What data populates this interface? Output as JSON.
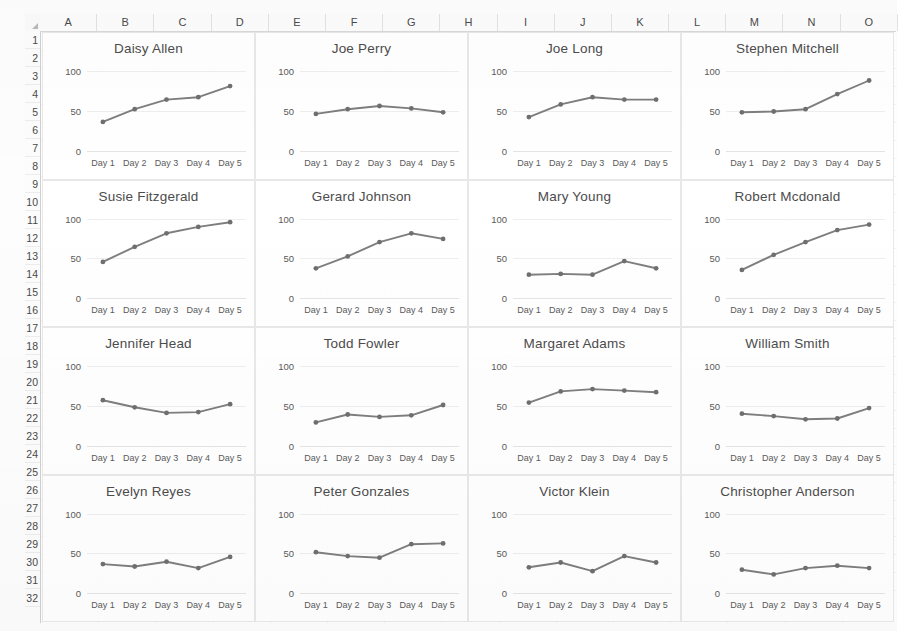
{
  "spreadsheet": {
    "select_all_icon": "select-all-triangle",
    "columns": [
      "A",
      "B",
      "C",
      "D",
      "E",
      "F",
      "G",
      "H",
      "I",
      "J",
      "K",
      "L",
      "M",
      "N",
      "O"
    ],
    "rows": [
      "1",
      "2",
      "3",
      "4",
      "5",
      "6",
      "7",
      "8",
      "9",
      "10",
      "11",
      "12",
      "13",
      "14",
      "15",
      "16",
      "17",
      "18",
      "19",
      "20",
      "21",
      "22",
      "23",
      "24",
      "25",
      "26",
      "27",
      "28",
      "29",
      "30",
      "31",
      "32"
    ]
  },
  "style": {
    "line_color": "#7e7e7e",
    "marker_color": "#6f6f6f",
    "gridline_color": "#eeeeee",
    "text_color": "#4c4c4c",
    "header_bg": "#fcfcfc"
  },
  "chart_data": [
    {
      "type": "line",
      "title": "Daisy Allen",
      "categories": [
        "Day 1",
        "Day 2",
        "Day 3",
        "Day 4",
        "Day 5"
      ],
      "values": [
        36,
        52,
        64,
        67,
        81
      ],
      "ylim": [
        0,
        100
      ],
      "yticks": [
        0,
        50,
        100
      ],
      "xlabel": "",
      "ylabel": "",
      "grid": true,
      "legend": "none"
    },
    {
      "type": "line",
      "title": "Joe Perry",
      "categories": [
        "Day 1",
        "Day 2",
        "Day 3",
        "Day 4",
        "Day 5"
      ],
      "values": [
        46,
        52,
        56,
        53,
        48
      ],
      "ylim": [
        0,
        100
      ],
      "yticks": [
        0,
        50,
        100
      ],
      "xlabel": "",
      "ylabel": "",
      "grid": true,
      "legend": "none"
    },
    {
      "type": "line",
      "title": "Joe Long",
      "categories": [
        "Day 1",
        "Day 2",
        "Day 3",
        "Day 4",
        "Day 5"
      ],
      "values": [
        42,
        58,
        67,
        64,
        64
      ],
      "ylim": [
        0,
        100
      ],
      "yticks": [
        0,
        50,
        100
      ],
      "xlabel": "",
      "ylabel": "",
      "grid": true,
      "legend": "none"
    },
    {
      "type": "line",
      "title": "Stephen Mitchell",
      "categories": [
        "Day 1",
        "Day 2",
        "Day 3",
        "Day 4",
        "Day 5"
      ],
      "values": [
        48,
        49,
        52,
        71,
        88
      ],
      "ylim": [
        0,
        100
      ],
      "yticks": [
        0,
        50,
        100
      ],
      "xlabel": "",
      "ylabel": "",
      "grid": true,
      "legend": "none"
    },
    {
      "type": "line",
      "title": "Susie Fitzgerald",
      "categories": [
        "Day 1",
        "Day 2",
        "Day 3",
        "Day 4",
        "Day 5"
      ],
      "values": [
        46,
        65,
        82,
        90,
        96
      ],
      "ylim": [
        0,
        100
      ],
      "yticks": [
        0,
        50,
        100
      ],
      "xlabel": "",
      "ylabel": "",
      "grid": true,
      "legend": "none"
    },
    {
      "type": "line",
      "title": "Gerard Johnson",
      "categories": [
        "Day 1",
        "Day 2",
        "Day 3",
        "Day 4",
        "Day 5"
      ],
      "values": [
        38,
        53,
        71,
        82,
        75
      ],
      "ylim": [
        0,
        100
      ],
      "yticks": [
        0,
        50,
        100
      ],
      "xlabel": "",
      "ylabel": "",
      "grid": true,
      "legend": "none"
    },
    {
      "type": "line",
      "title": "Mary Young",
      "categories": [
        "Day 1",
        "Day 2",
        "Day 3",
        "Day 4",
        "Day 5"
      ],
      "values": [
        30,
        31,
        30,
        47,
        38
      ],
      "ylim": [
        0,
        100
      ],
      "yticks": [
        0,
        50,
        100
      ],
      "xlabel": "",
      "ylabel": "",
      "grid": true,
      "legend": "none"
    },
    {
      "type": "line",
      "title": "Robert Mcdonald",
      "categories": [
        "Day 1",
        "Day 2",
        "Day 3",
        "Day 4",
        "Day 5"
      ],
      "values": [
        36,
        55,
        71,
        86,
        93
      ],
      "ylim": [
        0,
        100
      ],
      "yticks": [
        0,
        50,
        100
      ],
      "xlabel": "",
      "ylabel": "",
      "grid": true,
      "legend": "none"
    },
    {
      "type": "line",
      "title": "Jennifer Head",
      "categories": [
        "Day 1",
        "Day 2",
        "Day 3",
        "Day 4",
        "Day 5"
      ],
      "values": [
        57,
        48,
        41,
        42,
        52
      ],
      "ylim": [
        0,
        100
      ],
      "yticks": [
        0,
        50,
        100
      ],
      "xlabel": "",
      "ylabel": "",
      "grid": true,
      "legend": "none"
    },
    {
      "type": "line",
      "title": "Todd Fowler",
      "categories": [
        "Day 1",
        "Day 2",
        "Day 3",
        "Day 4",
        "Day 5"
      ],
      "values": [
        29,
        39,
        36,
        38,
        51
      ],
      "ylim": [
        0,
        100
      ],
      "yticks": [
        0,
        50,
        100
      ],
      "xlabel": "",
      "ylabel": "",
      "grid": true,
      "legend": "none"
    },
    {
      "type": "line",
      "title": "Margaret Adams",
      "categories": [
        "Day 1",
        "Day 2",
        "Day 3",
        "Day 4",
        "Day 5"
      ],
      "values": [
        54,
        68,
        71,
        69,
        67
      ],
      "ylim": [
        0,
        100
      ],
      "yticks": [
        0,
        50,
        100
      ],
      "xlabel": "",
      "ylabel": "",
      "grid": true,
      "legend": "none"
    },
    {
      "type": "line",
      "title": "William Smith",
      "categories": [
        "Day 1",
        "Day 2",
        "Day 3",
        "Day 4",
        "Day 5"
      ],
      "values": [
        40,
        37,
        33,
        34,
        47
      ],
      "ylim": [
        0,
        100
      ],
      "yticks": [
        0,
        50,
        100
      ],
      "xlabel": "",
      "ylabel": "",
      "grid": true,
      "legend": "none"
    },
    {
      "type": "line",
      "title": "Evelyn Reyes",
      "categories": [
        "Day 1",
        "Day 2",
        "Day 3",
        "Day 4",
        "Day 5"
      ],
      "values": [
        37,
        34,
        40,
        32,
        46
      ],
      "ylim": [
        0,
        100
      ],
      "yticks": [
        0,
        50,
        100
      ],
      "xlabel": "",
      "ylabel": "",
      "grid": true,
      "legend": "none"
    },
    {
      "type": "line",
      "title": "Peter Gonzales",
      "categories": [
        "Day 1",
        "Day 2",
        "Day 3",
        "Day 4",
        "Day 5"
      ],
      "values": [
        52,
        47,
        45,
        62,
        63
      ],
      "ylim": [
        0,
        100
      ],
      "yticks": [
        0,
        50,
        100
      ],
      "xlabel": "",
      "ylabel": "",
      "grid": true,
      "legend": "none"
    },
    {
      "type": "line",
      "title": "Victor Klein",
      "categories": [
        "Day 1",
        "Day 2",
        "Day 3",
        "Day 4",
        "Day 5"
      ],
      "values": [
        33,
        39,
        28,
        47,
        39
      ],
      "ylim": [
        0,
        100
      ],
      "yticks": [
        0,
        50,
        100
      ],
      "xlabel": "",
      "ylabel": "",
      "grid": true,
      "legend": "none"
    },
    {
      "type": "line",
      "title": "Christopher Anderson",
      "categories": [
        "Day 1",
        "Day 2",
        "Day 3",
        "Day 4",
        "Day 5"
      ],
      "values": [
        30,
        24,
        32,
        35,
        32
      ],
      "ylim": [
        0,
        100
      ],
      "yticks": [
        0,
        50,
        100
      ],
      "xlabel": "",
      "ylabel": "",
      "grid": true,
      "legend": "none"
    }
  ]
}
